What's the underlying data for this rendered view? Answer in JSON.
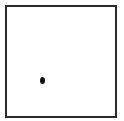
{
  "diagram": {
    "frame": {
      "shape": "square",
      "border_color": "#2b2b2b",
      "fill_color": "#ffffff"
    },
    "markers": [
      {
        "shape": "dot",
        "x": 42,
        "y": 80,
        "color": "#111111"
      }
    ]
  }
}
